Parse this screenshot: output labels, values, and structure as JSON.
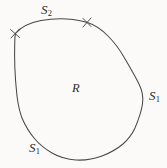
{
  "figure": {
    "name": "closed-region-with-labeled-boundary-arcs",
    "background_color": "#fbfaf8",
    "stroke_color": "#4a4845",
    "text_color": "#2e2c2a",
    "labels": {
      "region": {
        "text": "R",
        "subscript": "",
        "name": "region-label"
      },
      "arc_top": {
        "text": "S",
        "subscript": "2",
        "name": "boundary-arc-label-s2"
      },
      "arc_right": {
        "text": "S",
        "subscript": "1",
        "name": "boundary-arc-label-s1-right"
      },
      "arc_bottom": {
        "text": "S",
        "subscript": "1",
        "name": "boundary-arc-label-s1-bottom"
      }
    },
    "tick_marks": [
      {
        "name": "boundary-divider-tick-left",
        "x": 15,
        "y": 33
      },
      {
        "name": "boundary-divider-tick-right",
        "x": 87,
        "y": 22
      }
    ],
    "boundary_path": "M 15.5 33.5 C 21 27 30 22.5 41 20.5 C 52 18.6 64 18.4 73 19.6 C 80 20.5 84 21.6 87.5 22.6 C 95 25 102 30 108 36 C 115 43 120 50 124.5 58 C 130 67.5 135 76 139 84 C 142.5 91 143.5 97 142.5 104 C 141 113 138 121 135 128 C 132 134.5 128 139.5 123 144 C 117 149 110 153 102 156 C 94 159 85 160.5 76 160 C 67 159.5 59 157 52 153 C 45 149 39 144 34 138 C 29 132 25 125 22 118 C 19.5 111.5 18 104 17 96 C 16 87 15.2 77 14.8 67 C 14.5 57 14.6 47 14.8 40 C 14.9 37 15.1 35 15.5 33.5 Z"
  }
}
